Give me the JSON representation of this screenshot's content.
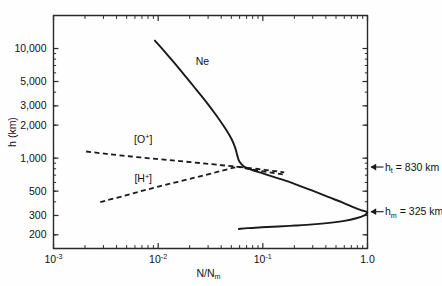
{
  "chart_data": {
    "type": "line",
    "title": "",
    "xlabel": "N/Nₘ",
    "ylabel": "h (km)",
    "xscale": "log",
    "yscale": "log",
    "xlim": [
      0.001,
      1.0
    ],
    "ylim": [
      150,
      20000
    ],
    "grid": false,
    "legend": "inline-annotations",
    "xticks": [
      {
        "value": 0.001,
        "mantissa": "10",
        "exponent": "-3",
        "label": "10⁻³"
      },
      {
        "value": 0.01,
        "mantissa": "10",
        "exponent": "-2",
        "label": "10⁻²"
      },
      {
        "value": 0.1,
        "mantissa": "10",
        "exponent": "-1",
        "label": "10⁻¹"
      },
      {
        "value": 1.0,
        "mantissa": "1.0",
        "exponent": "",
        "label": "1.0"
      }
    ],
    "yticks": [
      {
        "value": 10000,
        "label": "10,000"
      },
      {
        "value": 5000,
        "label": "5,000"
      },
      {
        "value": 3000,
        "label": "3,000"
      },
      {
        "value": 2000,
        "label": "2,000"
      },
      {
        "value": 1000,
        "label": "1,000"
      },
      {
        "value": 500,
        "label": "500"
      },
      {
        "value": 300,
        "label": "300"
      },
      {
        "value": 200,
        "label": "200"
      }
    ],
    "series": [
      {
        "name": "Ne",
        "label": "Ne",
        "style": "solid",
        "label_x": 0.0265,
        "label_y": 7100,
        "points": [
          [
            0.0093,
            11800
          ],
          [
            0.0122,
            8800
          ],
          [
            0.016,
            6500
          ],
          [
            0.0215,
            4600
          ],
          [
            0.0285,
            3300
          ],
          [
            0.036,
            2450
          ],
          [
            0.044,
            1850
          ],
          [
            0.0505,
            1480
          ],
          [
            0.0545,
            1240
          ],
          [
            0.057,
            1060
          ],
          [
            0.0595,
            935
          ],
          [
            0.066,
            840
          ],
          [
            0.079,
            780
          ],
          [
            0.103,
            720
          ],
          [
            0.14,
            655
          ],
          [
            0.195,
            590
          ],
          [
            0.29,
            510
          ],
          [
            0.42,
            443
          ],
          [
            0.58,
            393
          ],
          [
            0.74,
            355
          ],
          [
            0.88,
            334
          ],
          [
            0.975,
            325
          ],
          [
            0.99,
            318
          ],
          [
            0.93,
            300
          ],
          [
            0.78,
            283
          ],
          [
            0.6,
            268
          ],
          [
            0.43,
            257
          ],
          [
            0.3,
            249
          ],
          [
            0.205,
            243
          ],
          [
            0.14,
            238
          ],
          [
            0.098,
            234
          ],
          [
            0.072,
            230
          ],
          [
            0.059,
            226
          ]
        ]
      },
      {
        "name": "O+",
        "label": "[O⁺]",
        "style": "dashed",
        "label_x": 0.0072,
        "label_y": 1370,
        "points": [
          [
            0.00205,
            1150
          ],
          [
            0.0032,
            1095
          ],
          [
            0.0055,
            1035
          ],
          [
            0.0095,
            985
          ],
          [
            0.016,
            940
          ],
          [
            0.026,
            900
          ],
          [
            0.039,
            865
          ],
          [
            0.051,
            845
          ],
          [
            0.058,
            832
          ],
          [
            0.07,
            805
          ],
          [
            0.09,
            772
          ],
          [
            0.12,
            738
          ],
          [
            0.155,
            710
          ]
        ]
      },
      {
        "name": "H+",
        "label": "[H⁺]",
        "style": "dashed",
        "label_x": 0.0072,
        "label_y": 600,
        "points": [
          [
            0.0028,
            398
          ],
          [
            0.0048,
            455
          ],
          [
            0.008,
            520
          ],
          [
            0.0135,
            590
          ],
          [
            0.0225,
            665
          ],
          [
            0.035,
            740
          ],
          [
            0.048,
            800
          ],
          [
            0.058,
            832
          ],
          [
            0.072,
            815
          ],
          [
            0.096,
            790
          ],
          [
            0.13,
            762
          ],
          [
            0.16,
            742
          ]
        ]
      }
    ],
    "annotations": [
      {
        "id": "transition-height",
        "symbol": "h",
        "subscript": "t",
        "equals": "=",
        "value": "830",
        "unit": "km",
        "text": "hₜ = 830 km",
        "arrow": "left-arrow",
        "at_value": 830
      },
      {
        "id": "peak-height",
        "symbol": "h",
        "subscript": "m",
        "equals": "=",
        "value": "325",
        "unit": "km",
        "text": "hₘ = 325 km",
        "arrow": "left-arrow",
        "at_value": 325
      }
    ],
    "colors": {
      "axis": "#2a2a2a",
      "curve": "#1a1a1a",
      "background": "#fefefe",
      "text": "#111111"
    }
  }
}
